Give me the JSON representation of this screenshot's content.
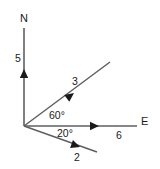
{
  "figure": {
    "type": "vector-diagram",
    "background_color": "#ffffff",
    "line_color": "#5f5f63",
    "text_color": "#1a1a1a",
    "width": 160,
    "height": 169,
    "origin": {
      "x": 24,
      "y": 126
    }
  },
  "axes": {
    "north": {
      "name": "North axis",
      "label": "N",
      "label_x": 24,
      "label_y": 22,
      "magnitude": "5",
      "magnitude_x": 18,
      "magnitude_y": 62,
      "angle_deg": 90,
      "end_x": 24,
      "end_y": 28,
      "arrow_x": 24,
      "arrow_y": 69
    },
    "east": {
      "name": "East axis",
      "label": "E",
      "label_x": 141,
      "label_y": 125,
      "magnitude": "6",
      "magnitude_x": 119,
      "magnitude_y": 139,
      "angle_deg": 0,
      "end_x": 137,
      "end_y": 126,
      "arrow_x": 99,
      "arrow_y": 126
    }
  },
  "vectors": [
    {
      "name": "vector-3",
      "magnitude": "3",
      "label_x": 75,
      "label_y": 85,
      "angle_deg": 60,
      "angle_from": "east",
      "direction": "up-right",
      "end_x": 110,
      "end_y": 62,
      "arrow_x": 74,
      "arrow_y": 93
    },
    {
      "name": "vector-2",
      "magnitude": "2",
      "label_x": 77,
      "label_y": 161,
      "angle_deg": 20,
      "angle_from": "east",
      "direction": "down-right",
      "end_x": 97,
      "end_y": 152,
      "arrow_x": 80,
      "arrow_y": 147
    }
  ],
  "angle_labels": [
    {
      "name": "angle-60",
      "text": "60°",
      "x": 49,
      "y": 119,
      "value": 60,
      "between": "east-axis and vector-3"
    },
    {
      "name": "angle-20",
      "text": "20°",
      "x": 57,
      "y": 137,
      "value": 20,
      "between": "east-axis and vector-2"
    }
  ]
}
